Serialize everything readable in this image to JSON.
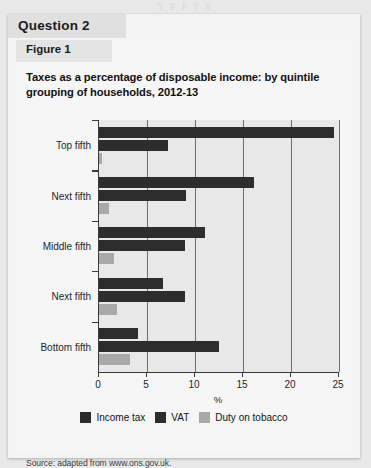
{
  "page": {
    "bleed_top_text": "y g  p y g"
  },
  "question": {
    "header_label": "Question 2"
  },
  "figure": {
    "header_label": "Figure 1",
    "title": "Taxes as a percentage of disposable income: by quintile grouping of households, 2012-13",
    "source": "Source: adapted from www.ons.gov.uk."
  },
  "colors": {
    "income_tax": "#2d2d2d",
    "vat": "#2d2d2d",
    "duty_on_tobacco": "#a9a9a9",
    "plot_background": "#e8e8e8",
    "axis": "#3a3a3a",
    "gridline": "#6e6e6e",
    "card_background": "#f6f6f6"
  },
  "chart_data": {
    "type": "bar",
    "orientation": "horizontal",
    "title": "Taxes as a percentage of disposable income: by quintile grouping of households, 2012-13",
    "xlabel": "%",
    "ylabel": "",
    "xlim": [
      0,
      25
    ],
    "xticks": [
      0,
      5,
      10,
      15,
      20,
      25
    ],
    "xtick_labels": [
      "0",
      "5",
      "10",
      "15",
      "20",
      "25"
    ],
    "grid": true,
    "legend_position": "bottom",
    "categories": [
      "Top fifth",
      "Next fifth",
      "Middle fifth",
      "Next fifth",
      "Bottom fifth"
    ],
    "series": [
      {
        "name": "Income tax",
        "color": "#2d2d2d",
        "values": [
          24.5,
          16.1,
          11.0,
          6.7,
          4.1
        ]
      },
      {
        "name": "VAT",
        "color": "#2d2d2d",
        "values": [
          7.2,
          9.1,
          9.0,
          9.0,
          12.5
        ]
      },
      {
        "name": "Duty on tobacco",
        "color": "#a9a9a9",
        "values": [
          0.3,
          1.0,
          1.6,
          1.9,
          3.2
        ]
      }
    ]
  }
}
